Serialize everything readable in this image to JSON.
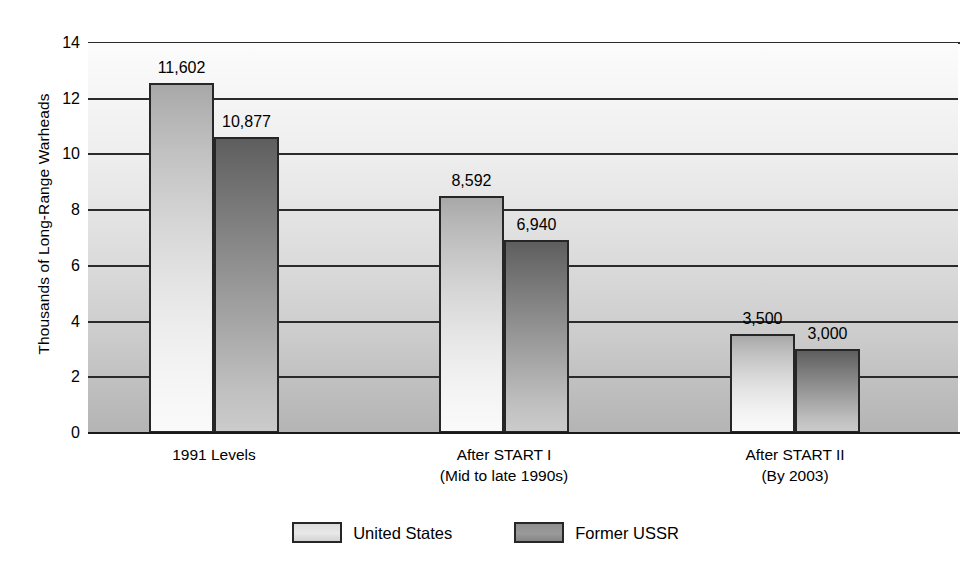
{
  "chart_data": {
    "type": "bar",
    "title": "",
    "xlabel": "",
    "ylabel": "Thousands of Long-Range Warheads",
    "ylim": [
      0,
      14
    ],
    "ytick_step": 2,
    "yticks": [
      "14",
      "12",
      "10",
      "8",
      "6",
      "4",
      "2",
      "0"
    ],
    "grid": true,
    "legend_position": "bottom-center",
    "categories": [
      "1991 Levels",
      "After START I\n(Mid to late 1990s)",
      "After START II\n(By 2003)"
    ],
    "category_lines": [
      [
        "1991 Levels",
        ""
      ],
      [
        "After START I",
        "(Mid to late 1990s)"
      ],
      [
        "After START II",
        "(By 2003)"
      ]
    ],
    "series": [
      {
        "name": "United States",
        "color": "#e3e3e3",
        "values": [
          11602,
          8592,
          3500
        ],
        "plotted": [
          12.55,
          8.5,
          3.56
        ],
        "labels": [
          "11,602",
          "8,592",
          "3,500"
        ]
      },
      {
        "name": "Former USSR",
        "color": "#8e8e8e",
        "values": [
          10877,
          6940,
          3000
        ],
        "plotted": [
          10.63,
          6.92,
          3.02
        ],
        "labels": [
          "10,877",
          "6,940",
          "3,000"
        ]
      }
    ]
  },
  "axis": {
    "y_title": "Thousands of Long-Range Warheads"
  },
  "legend": {
    "items": [
      {
        "label": "United States",
        "swatch": "legend-swatch-united-states"
      },
      {
        "label": "Former USSR",
        "swatch": "legend-swatch-former-ussr"
      }
    ]
  },
  "colors": {
    "plot_background_top": "#fcfcfc",
    "plot_background_bottom": "#b4b4b4",
    "gridline": "#2b2b2b",
    "bar_outline": "#262626",
    "us_bar_light": "#fafafa",
    "us_bar_dark": "#a8a8a8",
    "ussr_bar_light": "#cbcbcb",
    "ussr_bar_dark": "#5e5e5e",
    "text": "#000000"
  }
}
